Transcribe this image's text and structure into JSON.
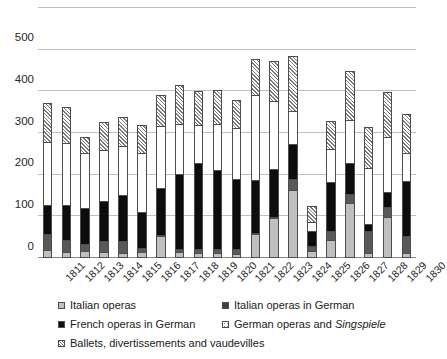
{
  "chart_data": {
    "type": "bar",
    "title": "",
    "xlabel": "",
    "ylabel": "",
    "ylim": [
      0,
      600
    ],
    "yticks": [
      0,
      100,
      200,
      300,
      400,
      500,
      600
    ],
    "grid": true,
    "stacked": true,
    "legend_position": "bottom",
    "categories": [
      "1811",
      "1812",
      "1813",
      "1814",
      "1815",
      "1816",
      "1817",
      "1818",
      "1819",
      "1820",
      "1821",
      "1822",
      "1823",
      "1824",
      "1825",
      "1826",
      "1827",
      "1828",
      "1829",
      "1830"
    ],
    "series": [
      {
        "name": "Italian operas",
        "color": "#bfbfbf",
        "values": [
          14,
          10,
          12,
          10,
          8,
          10,
          52,
          10,
          8,
          8,
          6,
          55,
          95,
          161,
          12,
          40,
          128,
          8,
          95,
          8
        ]
      },
      {
        "name": "Italian operas in German",
        "color": "#595959",
        "values": [
          53,
          38,
          30,
          37,
          36,
          20,
          20,
          18,
          18,
          16,
          16,
          50,
          78,
          187,
          26,
          62,
          150,
          62,
          120,
          48
        ]
      },
      {
        "name": "French operas in German",
        "color": "#0d0d0d",
        "values": [
          125,
          124,
          118,
          135,
          148,
          108,
          145,
          200,
          225,
          210,
          188,
          180,
          200,
          272,
          62,
          180,
          225,
          78,
          155,
          182
        ]
      },
      {
        "name": "German operas and Singspiele",
        "color": "#ffffff",
        "values": [
          278,
          275,
          252,
          258,
          268,
          252,
          308,
          320,
          318,
          320,
          312,
          390,
          372,
          352,
          86,
          260,
          330,
          215,
          290,
          250
        ]
      },
      {
        "name": "Ballets, divertissements and vaudevilles",
        "color": "#ffffff",
        "values": [
          373,
          362,
          290,
          326,
          338,
          320,
          392,
          415,
          400,
          404,
          380,
          478,
          472,
          484,
          125,
          330,
          448,
          315,
          398,
          346
        ]
      }
    ],
    "series_note": "values are cumulative stack tops per series",
    "totals": [
      373,
      362,
      290,
      326,
      338,
      320,
      392,
      415,
      400,
      404,
      380,
      478,
      472,
      484,
      125,
      330,
      448,
      315,
      398,
      346
    ]
  },
  "legend": {
    "items": [
      {
        "label": "Italian operas",
        "swatch": "s0",
        "italic": ""
      },
      {
        "label": "Italian operas in German",
        "swatch": "s1",
        "italic": ""
      },
      {
        "label": "French operas in German",
        "swatch": "s2",
        "italic": ""
      },
      {
        "label": "German operas and ",
        "swatch": "s3",
        "italic": "Singspiele"
      },
      {
        "label": "Ballets, divertissements and vaudevilles",
        "swatch": "s4",
        "italic": ""
      }
    ]
  }
}
